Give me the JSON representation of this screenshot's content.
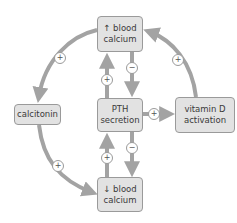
{
  "diagram": {
    "colors": {
      "box_fill": "#e2e2e2",
      "box_border": "#9a9a9a",
      "arrow": "#a3a3a3",
      "text": "#3a3a3a"
    },
    "nodes": {
      "high_calcium": {
        "line1": "↑ blood",
        "line2": "calcium"
      },
      "pth": {
        "line1": "PTH",
        "line2": "secretion"
      },
      "low_calcium": {
        "line1": "↓ blood",
        "line2": "calcium"
      },
      "calcitonin": {
        "line1": "calcitonin"
      },
      "vitamin_d": {
        "line1": "vitamin D",
        "line2": "activation"
      }
    },
    "edges": [
      {
        "from": "high_calcium",
        "to": "calcitonin",
        "sign": "+"
      },
      {
        "from": "calcitonin",
        "to": "low_calcium",
        "sign": "+"
      },
      {
        "from": "vitamin_d",
        "to": "high_calcium",
        "sign": "+"
      },
      {
        "from": "pth",
        "to": "vitamin_d",
        "sign": "+"
      },
      {
        "from": "pth",
        "to": "high_calcium",
        "sign": "+"
      },
      {
        "from": "high_calcium",
        "to": "pth",
        "sign": "−"
      },
      {
        "from": "low_calcium",
        "to": "pth",
        "sign": "+"
      },
      {
        "from": "pth",
        "to": "low_calcium",
        "sign": "−"
      }
    ],
    "signs": {
      "plus": "+",
      "minus": "−"
    }
  }
}
